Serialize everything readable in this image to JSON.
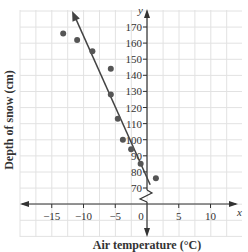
{
  "chart_data": {
    "type": "scatter",
    "title": "",
    "xlabel": "Air temperature (°C)",
    "ylabel": "Depth of snow (cm)",
    "x_axis_var": "x",
    "y_axis_var": "y",
    "xlim": [
      -20,
      15
    ],
    "ylim": [
      70,
      175
    ],
    "y_axis_break": true,
    "grid": true,
    "x_ticks": [
      "-15",
      "-10",
      "-5",
      "0",
      "5",
      "10"
    ],
    "y_ticks": [
      "70",
      "80",
      "90",
      "100",
      "110",
      "120",
      "130",
      "140",
      "150",
      "160",
      "170"
    ],
    "series": [
      {
        "name": "observations",
        "points": [
          {
            "x": -13.2,
            "y": 166
          },
          {
            "x": -11,
            "y": 162
          },
          {
            "x": -8.6,
            "y": 155
          },
          {
            "x": -5.7,
            "y": 144
          },
          {
            "x": -5.7,
            "y": 128
          },
          {
            "x": -4.6,
            "y": 113
          },
          {
            "x": -3.8,
            "y": 100
          },
          {
            "x": -2.5,
            "y": 94
          },
          {
            "x": -1,
            "y": 85
          },
          {
            "x": 1.4,
            "y": 76
          }
        ]
      },
      {
        "name": "line of best fit",
        "type": "line",
        "points": [
          {
            "x": -11.8,
            "y": 180
          },
          {
            "x": 0.5,
            "y": 72
          }
        ]
      }
    ],
    "colors": {
      "points": "#555555",
      "line": "#444444",
      "grid": "#e2e2e2",
      "axes": "#333333"
    }
  }
}
